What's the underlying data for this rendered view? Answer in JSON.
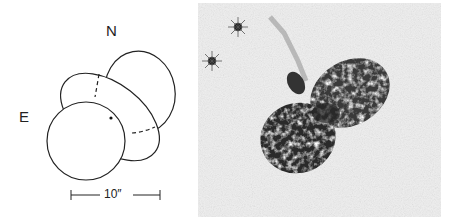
{
  "diagram": {
    "north_label": "N",
    "east_label": "E",
    "scale_label": "10″"
  },
  "photo": {
    "description": "Grayscale image of a bipolar nebula with two lobes and two nearby stars"
  }
}
